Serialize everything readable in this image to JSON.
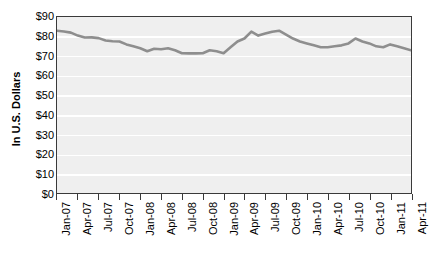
{
  "chart_data": {
    "type": "line",
    "title": "",
    "xlabel": "",
    "ylabel": "In U.S. Dollars",
    "ylim": [
      0,
      90
    ],
    "ytick_labels": [
      "$90",
      "$80",
      "$70",
      "$60",
      "$50",
      "$40",
      "$30",
      "$20",
      "$10",
      "$0"
    ],
    "ytick_values": [
      90,
      80,
      70,
      60,
      50,
      40,
      30,
      20,
      10,
      0
    ],
    "grid": "horizontal",
    "legend": "none",
    "line_color": "#8e8e8e",
    "plot_background": "#efefef",
    "gridline_color": "#ffffff",
    "xtick_labels": [
      "Jan-07",
      "Apr-07",
      "Jul-07",
      "Oct-07",
      "Jan-08",
      "Apr-08",
      "Jul-08",
      "Oct-08",
      "Jan-09",
      "Apr-09",
      "Jul-09",
      "Oct-09",
      "Jan-10",
      "Apr-10",
      "Jul-10",
      "Oct-10",
      "Jan-11",
      "Apr-11"
    ],
    "x": [
      "Jan-07",
      "Feb-07",
      "Mar-07",
      "Apr-07",
      "May-07",
      "Jun-07",
      "Jul-07",
      "Aug-07",
      "Sep-07",
      "Oct-07",
      "Nov-07",
      "Dec-07",
      "Jan-08",
      "Feb-08",
      "Mar-08",
      "Apr-08",
      "May-08",
      "Jun-08",
      "Jul-08",
      "Aug-08",
      "Sep-08",
      "Oct-08",
      "Nov-08",
      "Dec-08",
      "Jan-09",
      "Feb-09",
      "Mar-09",
      "Apr-09",
      "May-09",
      "Jun-09",
      "Jul-09",
      "Aug-09",
      "Sep-09",
      "Oct-09",
      "Nov-09",
      "Dec-09",
      "Jan-10",
      "Feb-10",
      "Mar-10",
      "Apr-10",
      "May-10",
      "Jun-10",
      "Jul-10",
      "Aug-10",
      "Sep-10",
      "Oct-10",
      "Nov-10",
      "Dec-10",
      "Jan-11",
      "Feb-11",
      "Mar-11",
      "Apr-11"
    ],
    "values": [
      83.0,
      82.6,
      82.0,
      80.5,
      79.5,
      79.6,
      79.2,
      78.0,
      77.6,
      77.5,
      76.0,
      75.0,
      74.0,
      72.5,
      73.8,
      73.5,
      74.0,
      73.0,
      71.5,
      71.4,
      71.4,
      71.5,
      73.0,
      72.5,
      71.5,
      74.5,
      77.5,
      79.0,
      82.5,
      80.5,
      81.5,
      82.5,
      83.0,
      81.0,
      79.0,
      77.5,
      76.5,
      75.5,
      74.5,
      74.5,
      75.0,
      75.5,
      76.5,
      79.0,
      77.5,
      76.5,
      75.0,
      74.5,
      76.0,
      75.0,
      74.0,
      73.0
    ],
    "units": "USD",
    "series_name": "Price"
  }
}
